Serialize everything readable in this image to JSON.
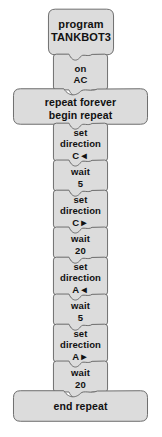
{
  "diagram": {
    "title": "TANKBOT3",
    "colors": {
      "block_fill": "#dcdcdc",
      "block_stroke": "#6b6b6b",
      "text": "#111111",
      "page_background": "#ffffff"
    }
  },
  "blocks": [
    {
      "id": "program-header",
      "kind": "hat",
      "lines": [
        "program",
        "TANKBOT3"
      ]
    },
    {
      "id": "power-source",
      "kind": "narrow",
      "lines": [
        "on",
        "AC"
      ]
    },
    {
      "id": "repeat-forever",
      "kind": "wide",
      "lines": [
        "repeat forever",
        "begin repeat"
      ]
    },
    {
      "id": "set-direction-1",
      "kind": "narrow",
      "lines": [
        "set",
        "direction",
        "C◄"
      ],
      "command": "set direction",
      "motor": "C",
      "direction": "left"
    },
    {
      "id": "wait-1",
      "kind": "narrow",
      "lines": [
        "wait",
        "5"
      ],
      "command": "wait",
      "value": "5"
    },
    {
      "id": "set-direction-2",
      "kind": "narrow",
      "lines": [
        "set",
        "direction",
        "C►"
      ],
      "command": "set direction",
      "motor": "C",
      "direction": "right"
    },
    {
      "id": "wait-2",
      "kind": "narrow",
      "lines": [
        "wait",
        "20"
      ],
      "command": "wait",
      "value": "20"
    },
    {
      "id": "set-direction-3",
      "kind": "narrow",
      "lines": [
        "set",
        "direction",
        "A◄"
      ],
      "command": "set direction",
      "motor": "A",
      "direction": "left"
    },
    {
      "id": "wait-3",
      "kind": "narrow",
      "lines": [
        "wait",
        "5"
      ],
      "command": "wait",
      "value": "5"
    },
    {
      "id": "set-direction-4",
      "kind": "narrow",
      "lines": [
        "set",
        "direction",
        "A►"
      ],
      "command": "set direction",
      "motor": "A",
      "direction": "right"
    },
    {
      "id": "wait-4",
      "kind": "narrow",
      "lines": [
        "wait",
        "20"
      ],
      "command": "wait",
      "value": "20"
    },
    {
      "id": "end-repeat",
      "kind": "wide",
      "lines": [
        "end repeat"
      ]
    }
  ]
}
